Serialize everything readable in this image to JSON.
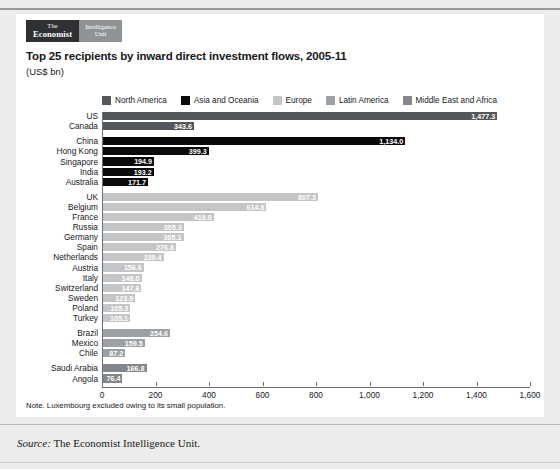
{
  "logo": {
    "the": "The",
    "economist": "Economist",
    "intelligence": "Intelligence",
    "unit": "Unit"
  },
  "chart_data": {
    "type": "bar",
    "orientation": "horizontal",
    "title": "Top 25 recipients by inward direct investment flows, 2005-11",
    "subtitle": "(US$ bn)",
    "xlabel": "",
    "ylabel": "",
    "xlim": [
      0,
      1600
    ],
    "xticks": [
      0,
      200,
      400,
      600,
      800,
      1000,
      1200,
      1400,
      1600
    ],
    "xtick_labels": [
      "0",
      "200",
      "400",
      "600",
      "800",
      "1,000",
      "1,200",
      "1,400",
      "1,600"
    ],
    "grid": false,
    "legend_position": "top",
    "legend": [
      {
        "name": "North America",
        "color": "#53565a"
      },
      {
        "name": "Asia and Oceania",
        "color": "#0a0a0a"
      },
      {
        "name": "Europe",
        "color": "#c3c5c7"
      },
      {
        "name": "Latin America",
        "color": "#9ea1a4"
      },
      {
        "name": "Middle East and Africa",
        "color": "#83868a"
      }
    ],
    "groups": [
      {
        "name": "North America",
        "color": "#53565a",
        "categories": [
          "US",
          "Canada"
        ],
        "values": [
          1477.3,
          343.6
        ],
        "labels": [
          "1,477.3",
          "343.6"
        ]
      },
      {
        "name": "Asia and Oceania",
        "color": "#0a0a0a",
        "categories": [
          "China",
          "Hong Kong",
          "Singapore",
          "India",
          "Australia"
        ],
        "values": [
          1134.0,
          399.3,
          194.9,
          193.2,
          171.7
        ],
        "labels": [
          "1,134.0",
          "399.3",
          "194.9",
          "193.2",
          "171.7"
        ]
      },
      {
        "name": "Europe",
        "color": "#c3c5c7",
        "categories": [
          "UK",
          "Belgium",
          "France",
          "Russia",
          "Germany",
          "Spain",
          "Netherlands",
          "Austria",
          "Italy",
          "Switzerland",
          "Sweden",
          "Poland",
          "Turkey"
        ],
        "values": [
          807.3,
          614.8,
          418.0,
          305.3,
          305.1,
          276.8,
          230.4,
          156.6,
          148.0,
          147.6,
          123.9,
          105.3,
          105.1
        ],
        "labels": [
          "807.3",
          "614.8",
          "418.0",
          "305.3",
          "305.1",
          "276.8",
          "230.4",
          "156.6",
          "148.0",
          "147.6",
          "123.9",
          "105.3",
          "105.1"
        ]
      },
      {
        "name": "Latin America",
        "color": "#9ea1a4",
        "categories": [
          "Brazil",
          "Mexico",
          "Chile"
        ],
        "values": [
          254.6,
          159.5,
          87.2
        ],
        "labels": [
          "254.6",
          "159.5",
          "87.2"
        ]
      },
      {
        "name": "Middle East and Africa",
        "color": "#83868a",
        "categories": [
          "Saudi Arabia",
          "Angola"
        ],
        "values": [
          166.8,
          76.4
        ],
        "labels": [
          "166.8",
          "76.4"
        ]
      }
    ],
    "note": "Note. Luxembourg excluded owing to its small population."
  },
  "source": {
    "prefix": "Source:",
    "text": "The Economist Intelligence Unit."
  }
}
